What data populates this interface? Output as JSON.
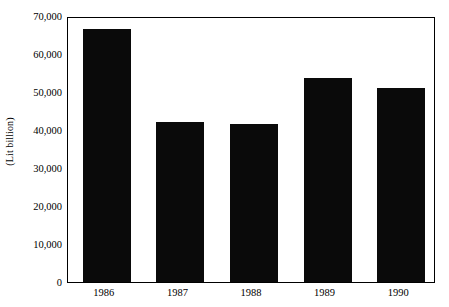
{
  "chart_data": {
    "type": "bar",
    "title": "",
    "xlabel": "",
    "ylabel": "(Lit billion)",
    "categories": [
      "1986",
      "1987",
      "1988",
      "1989",
      "1990"
    ],
    "values": [
      66500,
      42000,
      41500,
      53800,
      51000
    ],
    "ylim": [
      0,
      70000
    ],
    "ytick_values": [
      0,
      10000,
      20000,
      30000,
      40000,
      50000,
      60000,
      70000
    ],
    "ytick_labels": [
      "0",
      "10,000",
      "20,000",
      "30,000",
      "40,000",
      "50,000",
      "60,000",
      "70,000"
    ],
    "grid": false,
    "legend": null,
    "bar_color": "#0a0a0a",
    "background_color": "#ffffff",
    "axis_color": "#000000"
  }
}
